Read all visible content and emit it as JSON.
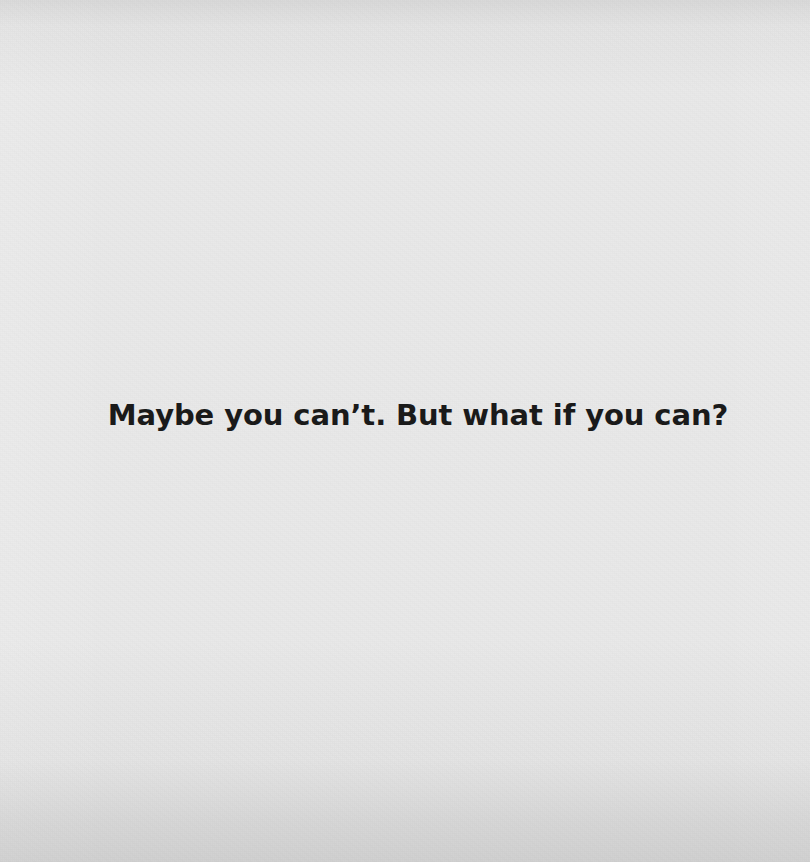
{
  "card": {
    "background_color": "#e9e9e9",
    "top_band_color": "#dcdcdc",
    "bottom_band_color": "#d7d7d7",
    "texture": "paper-grain"
  },
  "quote": {
    "text": "Maybe you can’t. But what if you can?",
    "color": "#1a1a1a",
    "alignment": "center"
  }
}
